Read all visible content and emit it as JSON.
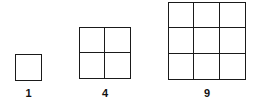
{
  "diagram": {
    "title": "",
    "squares": [
      {
        "n": 1,
        "label": "1",
        "x": 15,
        "y": 54,
        "size": 27
      },
      {
        "n": 2,
        "label": "4",
        "x": 79,
        "y": 27,
        "size": 52
      },
      {
        "n": 3,
        "label": "9",
        "x": 168,
        "y": 2,
        "size": 78
      }
    ],
    "colors": {
      "line": "#1a1a1a",
      "background": "#ffffff"
    }
  }
}
